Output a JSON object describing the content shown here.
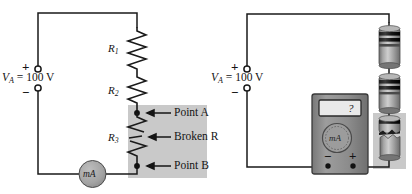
{
  "figure": {
    "background_color": "#ffffff",
    "wire_color": "#1a1a1a",
    "shade_color": "#c9c9c9",
    "meter_fill": "#a8a8a8",
    "body_fill": "#8e8e8e",
    "resistor_body": "#9a9a9a"
  },
  "left_circuit": {
    "name": "schematic-circuit",
    "source": {
      "label": "V",
      "subscript": "A",
      "equals": "=",
      "value": "100 V",
      "plus_sign": "+",
      "minus_sign": "−"
    },
    "resistors": [
      {
        "label": "R",
        "subscript": "1"
      },
      {
        "label": "R",
        "subscript": "2"
      },
      {
        "label": "R",
        "subscript": "3"
      }
    ],
    "meter": {
      "label": "mA"
    },
    "callouts": [
      {
        "text": "Point A"
      },
      {
        "text": "Broken R",
        "italic_tail": "R"
      },
      {
        "text": "Point B"
      }
    ]
  },
  "right_circuit": {
    "name": "pictorial-circuit",
    "source": {
      "label": "V",
      "subscript": "A",
      "equals": "=",
      "value": "100 V",
      "plus_sign": "+",
      "minus_sign": "−"
    },
    "multimeter": {
      "display_value": "?",
      "dial_label": "mA",
      "negative_terminal": "−",
      "positive_terminal": "+"
    },
    "components": [
      {
        "name": "resistor-top",
        "broken": false
      },
      {
        "name": "resistor-middle",
        "broken": false
      },
      {
        "name": "resistor-bottom-broken",
        "broken": true
      }
    ]
  }
}
